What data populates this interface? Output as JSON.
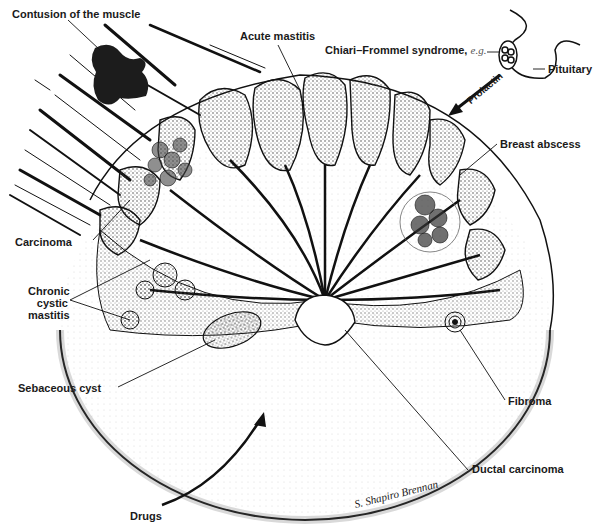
{
  "diagram": {
    "labels": {
      "contusion": "Contusion of the muscle",
      "acute_mastitis": "Acute mastitis",
      "chiari_frommel": "Chiari–Frommel syndrome,",
      "chiari_eg": "e.g.",
      "pituitary": "Pituitary",
      "prolactin": "Prolactin",
      "breast_abscess": "Breast abscess",
      "carcinoma": "Carcinoma",
      "chronic_cystic_mastitis_1": "Chronic",
      "chronic_cystic_mastitis_2": "cystic",
      "chronic_cystic_mastitis_3": "mastitis",
      "sebaceous_cyst": "Sebaceous cyst",
      "fibroma": "Fibroma",
      "ductal_carcinoma": "Ductal carcinoma",
      "drugs": "Drugs"
    },
    "signature": "S. Shapiro Brennan",
    "colors": {
      "ink": "#1a1a1a",
      "stipple": "#444444",
      "background": "#ffffff"
    }
  }
}
